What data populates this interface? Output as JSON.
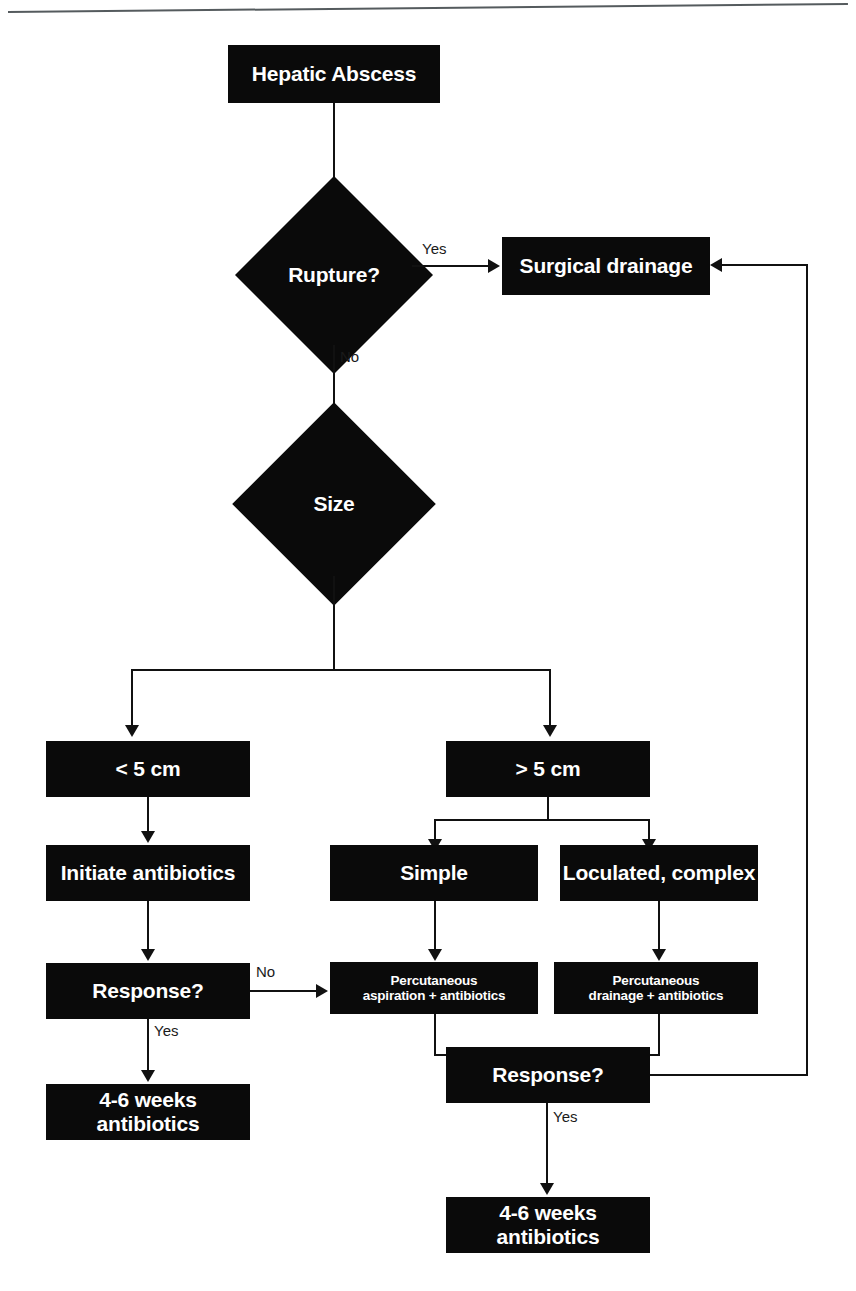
{
  "diagram": {
    "type": "flowchart",
    "colors": {
      "node_fill": "#0a0a0a",
      "node_text": "#ffffff",
      "edge": "#111111",
      "background": "#ffffff",
      "rule": "#555b5e"
    },
    "nodes": [
      {
        "id": "hepatic_abscess",
        "label": "Hepatic Abscess",
        "shape": "box"
      },
      {
        "id": "rupture",
        "label": "Rupture?",
        "shape": "diamond"
      },
      {
        "id": "surgical_drainage",
        "label": "Surgical drainage",
        "shape": "box"
      },
      {
        "id": "size",
        "label": "Size",
        "shape": "diamond"
      },
      {
        "id": "lt5",
        "label": "< 5 cm",
        "shape": "box"
      },
      {
        "id": "gt5",
        "label": "> 5 cm",
        "shape": "box"
      },
      {
        "id": "initiate_antibiotics",
        "label": "Initiate antibiotics",
        "shape": "box"
      },
      {
        "id": "simple",
        "label": "Simple",
        "shape": "box"
      },
      {
        "id": "loculated",
        "label": "Loculated, complex",
        "shape": "box"
      },
      {
        "id": "response_left",
        "label": "Response?",
        "shape": "box"
      },
      {
        "id": "perc_aspiration",
        "label": "Percutaneous\naspiration + antibiotics",
        "line1": "Percutaneous",
        "line2": "aspiration + antibiotics",
        "shape": "box"
      },
      {
        "id": "perc_drainage",
        "label": "Percutaneous\ndrainage + antibiotics",
        "line1": "Percutaneous",
        "line2": "drainage + antibiotics",
        "shape": "box"
      },
      {
        "id": "weeks_left",
        "label": "4-6 weeks antibiotics",
        "shape": "box"
      },
      {
        "id": "response_bottom",
        "label": "Response?",
        "shape": "box"
      },
      {
        "id": "weeks_bottom",
        "label": "4-6 weeks antibiotics",
        "shape": "box"
      }
    ],
    "edge_labels": {
      "rupture_yes": "Yes",
      "rupture_no": "No",
      "response_left_no": "No",
      "response_left_yes": "Yes",
      "response_bottom_yes": "Yes"
    },
    "edges": [
      {
        "from": "hepatic_abscess",
        "to": "rupture",
        "label": ""
      },
      {
        "from": "rupture",
        "to": "surgical_drainage",
        "label": "Yes"
      },
      {
        "from": "rupture",
        "to": "size",
        "label": "No"
      },
      {
        "from": "size",
        "to": "lt5",
        "label": ""
      },
      {
        "from": "size",
        "to": "gt5",
        "label": ""
      },
      {
        "from": "lt5",
        "to": "initiate_antibiotics",
        "label": ""
      },
      {
        "from": "initiate_antibiotics",
        "to": "response_left",
        "label": ""
      },
      {
        "from": "response_left",
        "to": "perc_aspiration",
        "label": "No"
      },
      {
        "from": "response_left",
        "to": "weeks_left",
        "label": "Yes"
      },
      {
        "from": "gt5",
        "to": "simple",
        "label": ""
      },
      {
        "from": "gt5",
        "to": "loculated",
        "label": ""
      },
      {
        "from": "simple",
        "to": "perc_aspiration",
        "label": ""
      },
      {
        "from": "loculated",
        "to": "perc_drainage",
        "label": ""
      },
      {
        "from": "perc_aspiration",
        "to": "response_bottom",
        "label": ""
      },
      {
        "from": "perc_drainage",
        "to": "response_bottom",
        "label": ""
      },
      {
        "from": "response_bottom",
        "to": "weeks_bottom",
        "label": "Yes"
      },
      {
        "from": "response_bottom",
        "to": "surgical_drainage",
        "label": ""
      }
    ]
  }
}
